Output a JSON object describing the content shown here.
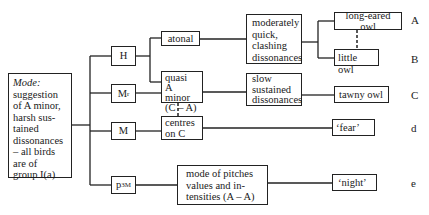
{
  "diagram": {
    "root": {
      "heading": "Mode:",
      "text": "suggestion of A minor, harsh sustained dissonances – all birds are of group I(a)",
      "lines": [
        "suggestion",
        "of A minor,",
        "harsh sus-",
        "tained",
        "dissonances",
        "– all birds",
        "are of",
        "group I(a)"
      ]
    },
    "level1": [
      {
        "id": "H",
        "base": "H",
        "sup": ""
      },
      {
        "id": "Mr",
        "base": "M",
        "sup": "r"
      },
      {
        "id": "M",
        "base": "M",
        "sup": ""
      },
      {
        "id": "p3M",
        "base": "p",
        "sup": "3M"
      }
    ],
    "level2": {
      "atonal": "atonal",
      "quasi": [
        "quasi",
        "A minor",
        "(C – A)"
      ],
      "centres": [
        "centres",
        "on C"
      ],
      "mode_pitches": [
        "mode of pitches",
        "values and in-",
        "tensities (A – A)"
      ]
    },
    "level3": {
      "moderately": [
        "moderately",
        "quick,",
        "clashing",
        "dissonances"
      ],
      "slow": [
        "slow",
        "sustained",
        "dissonances"
      ]
    },
    "leaves": [
      {
        "text": "long-eared owl",
        "label": "A"
      },
      {
        "text": "little owl",
        "label": "B"
      },
      {
        "text": "tawny owl",
        "label": "C"
      },
      {
        "text": "‘fear’",
        "label": "d"
      },
      {
        "text": "‘night’",
        "label": "e"
      }
    ],
    "edges": [
      [
        "root",
        "H"
      ],
      [
        "root",
        "Mr"
      ],
      [
        "root",
        "M"
      ],
      [
        "root",
        "p3M"
      ],
      [
        "H",
        "atonal"
      ],
      [
        "H",
        "quasi"
      ],
      [
        "Mr",
        "quasi"
      ],
      [
        "M",
        "centres"
      ],
      [
        "p3M",
        "mode_pitches"
      ],
      [
        "atonal",
        "moderately"
      ],
      [
        "quasi",
        "slow"
      ],
      [
        "moderately",
        "long-eared owl"
      ],
      [
        "moderately",
        "little owl"
      ],
      [
        "slow",
        "tawny owl"
      ],
      [
        "centres",
        "‘fear’"
      ],
      [
        "mode_pitches",
        "‘night’"
      ]
    ],
    "dashed_links": [
      [
        "long-eared owl",
        "little owl"
      ],
      [
        "quasi",
        "centres"
      ]
    ]
  }
}
